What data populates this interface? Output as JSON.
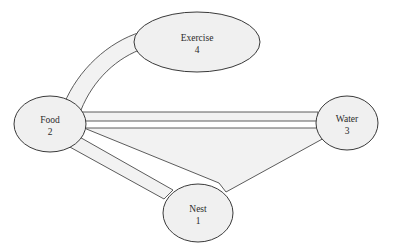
{
  "diagram": {
    "type": "node-link-graph",
    "background_color": "#ffffff",
    "node_fill_color": "#f0f0f0",
    "node_stroke_color": "#3a3a3a",
    "edge_fill_color": "#f2f2f2",
    "edge_stroke_color": "#4a4a4a",
    "text_color": "#2b2b2b",
    "nodes": [
      {
        "id": "nest",
        "label": "Nest",
        "value": "1",
        "shape": "ellipse",
        "cx": 198,
        "cy": 213,
        "rx": 35,
        "ry": 29
      },
      {
        "id": "food",
        "label": "Food",
        "value": "2",
        "shape": "ellipse",
        "cx": 50,
        "cy": 124,
        "rx": 36,
        "ry": 28
      },
      {
        "id": "water",
        "label": "Water",
        "value": "3",
        "shape": "ellipse",
        "cx": 347,
        "cy": 123,
        "rx": 31,
        "ry": 27
      },
      {
        "id": "exercise",
        "label": "Exercise",
        "value": "4",
        "shape": "ellipse",
        "cx": 197,
        "cy": 42,
        "rx": 63,
        "ry": 30
      }
    ],
    "edges": [
      {
        "id": "food-exercise",
        "from": "food",
        "to": "exercise",
        "style": "curved-band"
      },
      {
        "id": "food-water",
        "from": "food",
        "to": "water",
        "style": "straight-band"
      },
      {
        "id": "food-nest",
        "from": "food",
        "to": "nest",
        "style": "straight-band"
      },
      {
        "id": "nest-water",
        "from": "nest",
        "to": "water",
        "style": "straight-band"
      }
    ]
  }
}
